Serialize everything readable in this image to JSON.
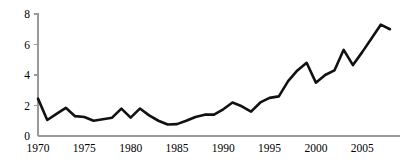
{
  "chart_data": {
    "type": "line",
    "title": "",
    "subtitle": "",
    "xlabel": "",
    "ylabel": "",
    "xlim": [
      1970,
      2008
    ],
    "ylim": [
      0,
      8
    ],
    "grid": false,
    "legend": null,
    "legend_position": "none",
    "line_color": "#111111",
    "axis_color": "#9a9a9a",
    "y_ticks": [
      0,
      2,
      4,
      6,
      8
    ],
    "y_tick_labels": [
      "0",
      "2",
      "4",
      "6",
      "8"
    ],
    "x_ticks": [
      1970,
      1975,
      1980,
      1985,
      1990,
      1995,
      2000,
      2005
    ],
    "x_tick_labels": [
      "1970",
      "1975",
      "1980",
      "1985",
      "1990",
      "1995",
      "2000",
      "2005"
    ],
    "x": [
      1970,
      1971,
      1972,
      1973,
      1974,
      1975,
      1976,
      1977,
      1978,
      1979,
      1980,
      1981,
      1982,
      1983,
      1984,
      1985,
      1986,
      1987,
      1988,
      1989,
      1990,
      1991,
      1992,
      1993,
      1994,
      1995,
      1996,
      1997,
      1998,
      1999,
      2000,
      2001,
      2002,
      2003,
      2004,
      2005,
      2006,
      2007,
      2008
    ],
    "values": [
      2.45,
      1.05,
      1.45,
      1.85,
      1.3,
      1.25,
      1.0,
      1.1,
      1.2,
      1.8,
      1.2,
      1.8,
      1.35,
      1.0,
      0.75,
      0.78,
      1.0,
      1.25,
      1.4,
      1.4,
      1.75,
      2.2,
      1.95,
      1.6,
      2.2,
      2.5,
      2.6,
      3.6,
      4.3,
      4.8,
      3.5,
      4.0,
      4.3,
      5.65,
      4.65,
      5.5,
      6.4,
      7.3,
      7.0
    ],
    "series": [
      {
        "name": "",
        "values": [
          2.45,
          1.05,
          1.45,
          1.85,
          1.3,
          1.25,
          1.0,
          1.1,
          1.2,
          1.8,
          1.2,
          1.8,
          1.35,
          1.0,
          0.75,
          0.78,
          1.0,
          1.25,
          1.4,
          1.4,
          1.75,
          2.2,
          1.95,
          1.6,
          2.2,
          2.5,
          2.6,
          3.6,
          4.3,
          4.8,
          3.5,
          4.0,
          4.3,
          5.65,
          4.65,
          5.5,
          6.4,
          7.3,
          7.0
        ]
      }
    ]
  }
}
